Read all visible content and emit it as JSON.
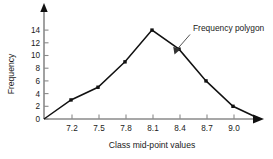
{
  "chart_data": {
    "type": "line",
    "title": "",
    "xlabel": "Class mid-point values",
    "ylabel": "Frequency",
    "x": [
      6.9,
      7.2,
      7.5,
      7.8,
      8.1,
      8.4,
      8.7,
      9.0,
      9.3
    ],
    "values": [
      0,
      3,
      5,
      9,
      14,
      11,
      6,
      2,
      0
    ],
    "series": [
      {
        "name": "Frequency polygon",
        "values": [
          0,
          3,
          5,
          9,
          14,
          11,
          6,
          2,
          0
        ]
      }
    ],
    "x_tick_labels": [
      "7.2",
      "7.5",
      "7.8",
      "8.1",
      "8.4",
      "8.7",
      "9.0"
    ],
    "x_tick_values": [
      7.2,
      7.5,
      7.8,
      8.1,
      8.4,
      8.7,
      9.0
    ],
    "y_tick_labels": [
      "0",
      "2",
      "4",
      "6",
      "8",
      "10",
      "12",
      "14"
    ],
    "y_tick_values": [
      0,
      2,
      4,
      6,
      8,
      10,
      12,
      14
    ],
    "xlim": [
      6.9,
      9.45
    ],
    "ylim": [
      0,
      15.5
    ],
    "grid": false,
    "legend": "none",
    "annotations": [
      {
        "text": "Frequency polygon",
        "points_to_x": 8.55,
        "points_to_y": 8.5
      }
    ],
    "marker": "filled-square",
    "line_color": "#111111",
    "axis_color": "#8a8a8a"
  },
  "axes": {
    "y_title": "Frequency",
    "x_title": "Class mid-point values"
  },
  "annotation": {
    "label": "Frequency polygon"
  },
  "ticks": {
    "x": [
      "7.2",
      "7.5",
      "7.8",
      "8.1",
      "8.4",
      "8.7",
      "9.0"
    ],
    "y": [
      "14",
      "12",
      "10",
      "8",
      "6",
      "4",
      "2",
      "0"
    ]
  }
}
